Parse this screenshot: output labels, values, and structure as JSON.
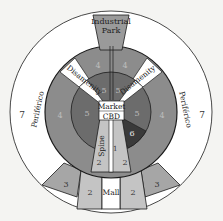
{
  "diagram": {
    "colors": {
      "background": "#f4f4f2",
      "zone7": "#ffffff",
      "zone4": "#8c8c8c",
      "zone5": "#6c6c6c",
      "zone6": "#3a3a3a",
      "zone3": "#a6a6a6",
      "zone2": "#c4c4c4",
      "zone1": "#d8d8d8",
      "industrial": "#9a9a9a",
      "disamenity": "#ffffff",
      "cbd": "#ffffff",
      "stroke": "#1a1a1a"
    },
    "labels": {
      "industrial_line1": "Industrial",
      "industrial_line2": "Park",
      "disamenity_left": "Disamenity",
      "disamenity_right": "Disamenity",
      "periferico_left": "Periférico",
      "periferico_right": "Periférico",
      "market": "Market",
      "cbd": "CBD",
      "spine": "Spine",
      "mall": "Mall"
    },
    "zones": {
      "z7_left": "7",
      "z7_right": "7",
      "z4_top_left": "4",
      "z4_top_right": "4",
      "z4_left": "4",
      "z4_right": "4",
      "z5_top_left": "5",
      "z5_top_right": "5",
      "z5_left": "5",
      "z5_right": "5",
      "z6": "6",
      "z1": "1",
      "z2_inner_left": "2",
      "z2_inner_right": "2",
      "z2_outer_left": "2",
      "z2_outer_right": "2",
      "z3_left": "3",
      "z3_right": "3"
    }
  }
}
